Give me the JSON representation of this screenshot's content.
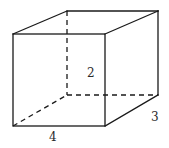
{
  "diagram": {
    "type": "rectangular-prism",
    "labels": {
      "height": "2",
      "depth": "3",
      "width": "4"
    },
    "colors": {
      "line": "#1a1a1a",
      "background": "#ffffff"
    }
  }
}
